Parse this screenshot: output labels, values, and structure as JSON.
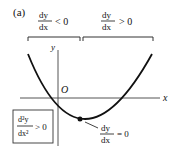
{
  "figure": {
    "label": "(a)",
    "axes": {
      "x_label": "x",
      "y_label": "y",
      "origin_label": "O"
    },
    "left_region": {
      "numerator": "dy",
      "denominator": "dx",
      "relation": "< 0"
    },
    "right_region": {
      "numerator": "dy",
      "denominator": "dx",
      "relation": "> 0"
    },
    "stationary_point": {
      "numerator": "dy",
      "denominator": "dx",
      "relation": "= 0"
    },
    "concavity_box": {
      "numerator": "d²y",
      "denominator": "dx²",
      "relation": "> 0"
    },
    "colors": {
      "ink": "#111111",
      "axis": "#555555",
      "background": "#ffffff"
    }
  }
}
